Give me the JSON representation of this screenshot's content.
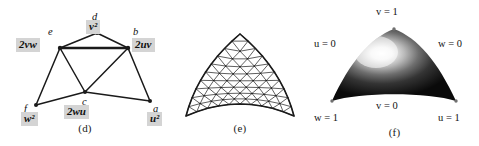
{
  "figure": {
    "background_color": "#ffffff",
    "ink_color": "#1a1a1a",
    "label_box_color": "#d4d4d4",
    "width": 479,
    "height": 146
  },
  "panels": [
    {
      "id": "d",
      "caption": "(d)",
      "type": "labeled-graph",
      "description": "Triangulated control-point graph with Bernstein weight labels",
      "vertices": [
        {
          "key": "d",
          "name": "d",
          "weight": "v",
          "weight_exp": "2",
          "weight_text": "v²",
          "x": 97,
          "y": 33,
          "name_dx": -5,
          "name_dy": -22,
          "weight_dx": -11,
          "weight_dy": -13
        },
        {
          "key": "e",
          "name": "e",
          "weight": "2vw",
          "weight_exp": "",
          "weight_text": "2vw",
          "x": 60,
          "y": 48,
          "name_dx": -12,
          "name_dy": -22,
          "weight_dx": -44,
          "weight_dy": -10
        },
        {
          "key": "b",
          "name": "b",
          "weight": "2uv",
          "weight_exp": "",
          "weight_text": "2uv",
          "x": 128,
          "y": 48,
          "name_dx": 5,
          "name_dy": -22,
          "weight_dx": 4,
          "weight_dy": -10
        },
        {
          "key": "c",
          "name": "c",
          "weight": "2wu",
          "weight_exp": "",
          "weight_text": "2wu",
          "x": 85,
          "y": 92,
          "name_dx": -3,
          "name_dy": 4,
          "weight_dx": -21,
          "weight_dy": 13
        },
        {
          "key": "f",
          "name": "f",
          "weight": "w",
          "weight_exp": "2",
          "weight_text": "w²",
          "x": 36,
          "y": 105,
          "name_dx": -12,
          "name_dy": -2,
          "weight_dx": -15,
          "weight_dy": 7
        },
        {
          "key": "a",
          "name": "a",
          "weight": "u",
          "weight_exp": "2",
          "weight_text": "u²",
          "x": 150,
          "y": 101,
          "name_dx": 3,
          "name_dy": 2,
          "weight_dx": -3,
          "weight_dy": 11
        }
      ],
      "edges": [
        {
          "from": "d",
          "to": "e"
        },
        {
          "from": "d",
          "to": "b"
        },
        {
          "from": "e",
          "to": "b"
        },
        {
          "from": "e",
          "to": "c"
        },
        {
          "from": "e",
          "to": "f"
        },
        {
          "from": "b",
          "to": "c"
        },
        {
          "from": "b",
          "to": "a"
        },
        {
          "from": "c",
          "to": "f"
        },
        {
          "from": "c",
          "to": "a"
        }
      ]
    },
    {
      "id": "e",
      "caption": "(e)",
      "type": "wireframe-mesh",
      "description": "Triangulated wireframe dome surface",
      "mesh_subdivisions": 10
    },
    {
      "id": "f",
      "caption": "(f)",
      "type": "shaded-surface",
      "description": "Shaded Bezier triangle patch with barycentric coordinate boundary labels",
      "labels": [
        {
          "key": "v1",
          "var": "v",
          "value": "1",
          "text": "v = 1",
          "x": 84,
          "y": 12,
          "align": "center"
        },
        {
          "key": "u0",
          "var": "u",
          "value": "0",
          "text": "u = 0",
          "x": 22,
          "y": 44,
          "align": "center"
        },
        {
          "key": "w0",
          "var": "w",
          "value": "0",
          "text": "w = 0",
          "x": 146,
          "y": 44,
          "align": "center"
        },
        {
          "key": "v0",
          "var": "v",
          "value": "0",
          "text": "v = 0",
          "x": 84,
          "y": 106,
          "align": "center"
        },
        {
          "key": "w1",
          "var": "w",
          "value": "1",
          "text": "w = 1",
          "x": 22,
          "y": 118,
          "align": "center"
        },
        {
          "key": "u1",
          "var": "u",
          "value": "1",
          "text": "u = 1",
          "x": 146,
          "y": 118,
          "align": "center"
        }
      ]
    }
  ]
}
